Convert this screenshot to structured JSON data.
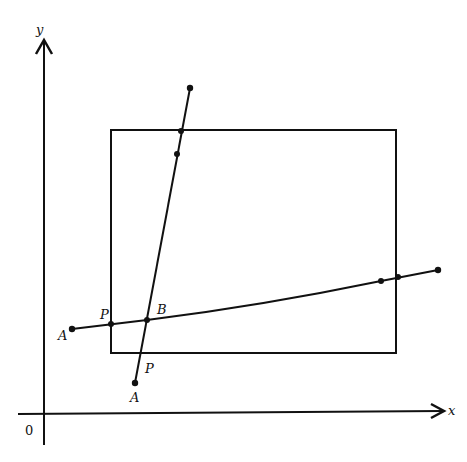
{
  "diagram": {
    "axes": {
      "x_label": "x",
      "y_label": "y",
      "origin_label": "0"
    },
    "rectangle": {
      "x1": 111,
      "y1": 130,
      "x2": 396,
      "y2": 353
    },
    "lines": [
      {
        "name": "steep-line",
        "from": [
          135,
          383
        ],
        "to": [
          190,
          88
        ]
      },
      {
        "name": "shallow-line",
        "from": [
          72,
          329
        ],
        "to": [
          438,
          270
        ]
      }
    ],
    "points": [
      {
        "name": "steep-start-A",
        "x": 135,
        "y": 383
      },
      {
        "name": "steep-end",
        "x": 190,
        "y": 88
      },
      {
        "name": "steep-top-edge-crossing",
        "x": 181,
        "y": 130
      },
      {
        "name": "steep-inner-point",
        "x": 177,
        "y": 153
      },
      {
        "name": "intersection-B",
        "x": 147,
        "y": 320
      },
      {
        "name": "shallow-start-A",
        "x": 72,
        "y": 329
      },
      {
        "name": "shallow-left-edge-P",
        "x": 111,
        "y": 324
      },
      {
        "name": "shallow-inner-point",
        "x": 381,
        "y": 281
      },
      {
        "name": "shallow-right-edge-crossing",
        "x": 398,
        "y": 278
      },
      {
        "name": "shallow-end",
        "x": 438,
        "y": 270
      }
    ],
    "labels": {
      "A_left": "A",
      "P_left": "P",
      "B": "B",
      "P_bottom": "P",
      "A_bottom": "A"
    }
  }
}
